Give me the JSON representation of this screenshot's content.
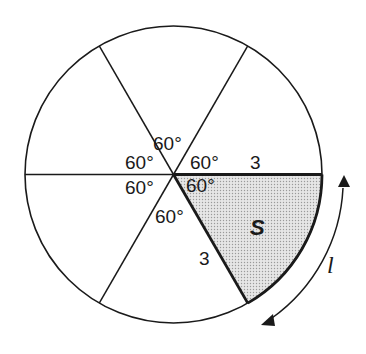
{
  "diagram": {
    "circle": {
      "cx": 173.5,
      "cy": 174.5,
      "r": 148.5
    },
    "sector_count": 6,
    "angle_labels": [
      "60°",
      "60°",
      "60°",
      "60°",
      "60°",
      "60°"
    ],
    "radius_labels": {
      "top": "3",
      "slanted": "3"
    },
    "shaded_sector_label": "S",
    "arc_length_label": "l",
    "colors": {
      "stroke": "#1a1a1a",
      "shade": "#d9d9d9",
      "background": "#ffffff"
    }
  }
}
